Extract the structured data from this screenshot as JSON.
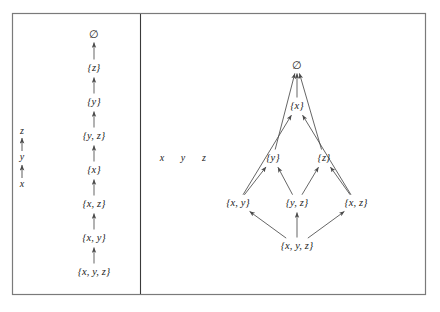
{
  "figure": {
    "background_color": "#ffffff",
    "frame_color": "#7a7a7a",
    "divider_color": "#3a3a3a",
    "edge_color": "#4a4a4a",
    "text_color": "#1c1c1c",
    "frame": {
      "x": 12,
      "y": 13,
      "width": 414,
      "height": 282
    },
    "divider": {
      "x": 140,
      "y1": 14,
      "y2": 294
    }
  },
  "left_panel": {
    "name": "total-order-chain",
    "chain_x": 94,
    "scale": {
      "x": 22,
      "labels": [
        {
          "text": "z",
          "x": 22,
          "y": 131
        },
        {
          "text": "y",
          "x": 22,
          "y": 157
        },
        {
          "text": "x",
          "x": 22,
          "y": 184
        }
      ],
      "arrows": [
        {
          "x": 22,
          "y1": 151,
          "y2": 138
        },
        {
          "x": 22,
          "y1": 178,
          "y2": 165
        }
      ]
    },
    "nodes": [
      {
        "id": "empty",
        "text": "∅",
        "x": 94,
        "y": 34,
        "empty": true
      },
      {
        "id": "z",
        "text": "{z}",
        "x": 94,
        "y": 68,
        "empty": false
      },
      {
        "id": "y",
        "text": "{y}",
        "x": 94,
        "y": 102,
        "empty": false
      },
      {
        "id": "yz",
        "text": "{y, z}",
        "x": 94,
        "y": 136,
        "empty": false
      },
      {
        "id": "x",
        "text": "{x}",
        "x": 94,
        "y": 170,
        "empty": false
      },
      {
        "id": "xz",
        "text": "{x, z}",
        "x": 94,
        "y": 204,
        "empty": false
      },
      {
        "id": "xy",
        "text": "{x, y}",
        "x": 94,
        "y": 238,
        "empty": false
      },
      {
        "id": "xyz",
        "text": "{x, y, z}",
        "x": 94,
        "y": 272,
        "empty": false
      }
    ],
    "edges": [
      {
        "from": "z",
        "to": "empty"
      },
      {
        "from": "y",
        "to": "z"
      },
      {
        "from": "yz",
        "to": "y"
      },
      {
        "from": "x",
        "to": "yz"
      },
      {
        "from": "xz",
        "to": "x"
      },
      {
        "from": "xy",
        "to": "xz"
      },
      {
        "from": "xyz",
        "to": "xy"
      }
    ]
  },
  "variables_legend": {
    "name": "variable-legend",
    "items": [
      {
        "text": "x",
        "x": 162,
        "y": 158
      },
      {
        "text": "y",
        "x": 183,
        "y": 158
      },
      {
        "text": "z",
        "x": 204,
        "y": 158
      }
    ]
  },
  "right_panel": {
    "name": "partial-order-hasse-diagram",
    "nodes": [
      {
        "id": "empty",
        "text": "∅",
        "x": 297,
        "y": 65,
        "empty": true
      },
      {
        "id": "x",
        "text": "{x}",
        "x": 297,
        "y": 106,
        "empty": false
      },
      {
        "id": "y",
        "text": "{y}",
        "x": 273,
        "y": 158,
        "empty": false
      },
      {
        "id": "z",
        "text": "{z}",
        "x": 324,
        "y": 158,
        "empty": false
      },
      {
        "id": "xy",
        "text": "{x, y}",
        "x": 238,
        "y": 203,
        "empty": false
      },
      {
        "id": "yz",
        "text": "{y, z}",
        "x": 297,
        "y": 203,
        "empty": false
      },
      {
        "id": "xz",
        "text": "{x, z}",
        "x": 356,
        "y": 203,
        "empty": false
      },
      {
        "id": "xyz",
        "text": "{x, y, z}",
        "x": 297,
        "y": 246,
        "empty": false
      }
    ],
    "edges": [
      {
        "from": "x",
        "to": "empty"
      },
      {
        "from": "y",
        "to": "empty"
      },
      {
        "from": "z",
        "to": "empty"
      },
      {
        "from": "xy",
        "to": "x"
      },
      {
        "from": "xz",
        "to": "x"
      },
      {
        "from": "xy",
        "to": "y"
      },
      {
        "from": "yz",
        "to": "y"
      },
      {
        "from": "yz",
        "to": "z"
      },
      {
        "from": "xz",
        "to": "z"
      },
      {
        "from": "xyz",
        "to": "xy"
      },
      {
        "from": "xyz",
        "to": "yz"
      },
      {
        "from": "xyz",
        "to": "xz"
      }
    ]
  }
}
